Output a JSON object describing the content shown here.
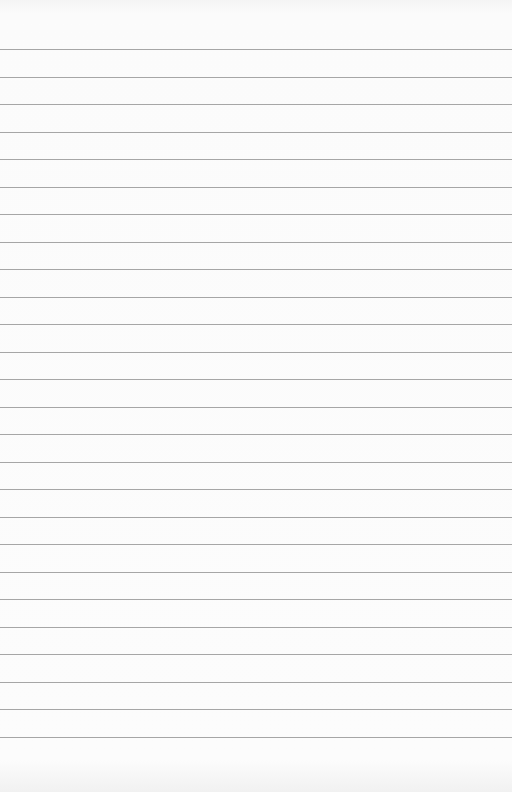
{
  "paper": {
    "type": "lined-paper",
    "background_color": "#fbfbfb",
    "line_color": "#a6a6a6",
    "first_line_y": 49,
    "line_spacing": 27.5,
    "line_count": 26
  }
}
